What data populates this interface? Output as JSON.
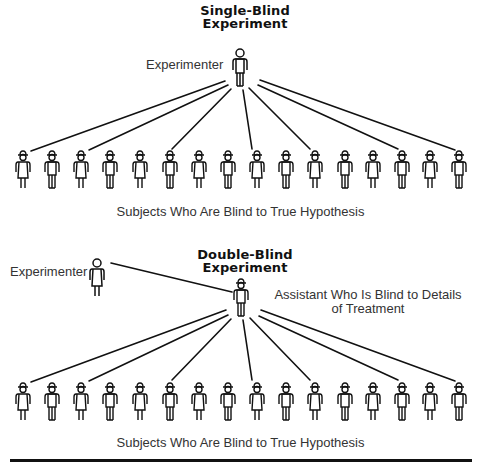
{
  "single_blind": {
    "title_line1": "Single-Blind",
    "title_line2": "Experiment",
    "experimenter_label": "Experimenter",
    "subjects_caption": "Subjects Who Are Blind to True Hypothesis",
    "subject_count": 16,
    "connected_subjects": [
      1,
      3,
      6,
      9,
      11,
      14,
      16
    ]
  },
  "double_blind": {
    "title_line1": "Double-Blind",
    "title_line2": "Experiment",
    "experimenter_label": "Experimenter",
    "assistant_label_line1": "Assistant Who Is Blind to Details",
    "assistant_label_line2": "of Treatment",
    "subjects_caption": "Subjects Who Are Blind to True Hypothesis",
    "subject_count": 16,
    "connected_subjects": [
      1,
      3,
      6,
      9,
      11,
      14,
      16
    ]
  },
  "subject_pattern": [
    "dress",
    "pants",
    "dress",
    "pants",
    "dress",
    "pants",
    "dress",
    "pants",
    "dress",
    "pants",
    "dress",
    "pants",
    "dress",
    "pants",
    "dress",
    "pants"
  ],
  "colors": {
    "ink": "#111111",
    "text": "#333333",
    "background": "#ffffff"
  }
}
